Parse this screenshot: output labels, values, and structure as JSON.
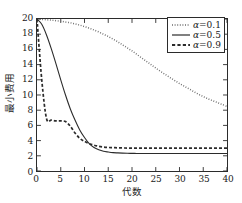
{
  "chart_data": {
    "type": "line",
    "title": "",
    "xlabel": "代数",
    "ylabel": "最小费用",
    "xlim": [
      0,
      40
    ],
    "ylim": [
      0,
      20
    ],
    "xticks": [
      0,
      5,
      10,
      15,
      20,
      25,
      30,
      35,
      40
    ],
    "yticks": [
      0,
      2,
      4,
      6,
      8,
      10,
      12,
      14,
      16,
      18,
      20
    ],
    "grid": false,
    "legend_position": "upper right",
    "series": [
      {
        "name": "α=0.1",
        "symbol": "α",
        "value": "0.1",
        "style": "dotted",
        "color": "#6b6b6b",
        "x": [
          0,
          1,
          2,
          3,
          4,
          5,
          6,
          7,
          8,
          9,
          10,
          11,
          12,
          13,
          14,
          15,
          16,
          17,
          18,
          19,
          20,
          21,
          22,
          23,
          24,
          25,
          26,
          27,
          28,
          29,
          30,
          31,
          32,
          33,
          34,
          35,
          36,
          37,
          38,
          39,
          40
        ],
        "y": [
          20.0,
          19.95,
          19.9,
          19.85,
          19.78,
          19.7,
          19.6,
          19.5,
          19.35,
          19.2,
          19.0,
          18.8,
          18.55,
          18.3,
          18.0,
          17.7,
          17.35,
          17.0,
          16.6,
          16.2,
          15.8,
          15.35,
          14.9,
          14.45,
          14.0,
          13.55,
          13.1,
          12.7,
          12.3,
          11.9,
          11.5,
          11.15,
          10.8,
          10.45,
          10.1,
          9.8,
          9.5,
          9.25,
          9.0,
          8.75,
          8.5
        ]
      },
      {
        "name": "α=0.5",
        "symbol": "α",
        "value": "0.5",
        "style": "solid",
        "color": "#2b2b2b",
        "x": [
          0,
          1,
          2,
          3,
          4,
          5,
          6,
          7,
          8,
          9,
          10,
          11,
          12,
          13,
          14,
          15,
          16,
          17,
          18,
          19,
          20,
          21,
          22,
          23,
          24,
          25,
          26,
          27,
          28,
          29,
          30,
          31,
          32,
          33,
          34,
          35,
          36,
          37,
          38,
          39,
          40
        ],
        "y": [
          20.0,
          19.3,
          17.9,
          16.1,
          14.1,
          12.0,
          10.0,
          8.2,
          6.7,
          5.4,
          4.4,
          3.6,
          3.1,
          2.8,
          2.6,
          2.5,
          2.42,
          2.38,
          2.35,
          2.33,
          2.32,
          2.31,
          2.3,
          2.3,
          2.3,
          2.3,
          2.3,
          2.3,
          2.3,
          2.3,
          2.3,
          2.3,
          2.3,
          2.3,
          2.3,
          2.3,
          2.3,
          2.3,
          2.3,
          2.3,
          2.3
        ]
      },
      {
        "name": "α=0.9",
        "symbol": "α",
        "value": "0.9",
        "style": "dashed",
        "color": "#2b2b2b",
        "x": [
          0,
          1,
          2,
          3,
          4,
          5,
          6,
          7,
          8,
          9,
          10,
          11,
          12,
          13,
          14,
          15,
          16,
          17,
          18,
          19,
          20,
          21,
          22,
          23,
          24,
          25,
          26,
          27,
          28,
          29,
          30,
          31,
          32,
          33,
          34,
          35,
          36,
          37,
          38,
          39,
          40
        ],
        "y": [
          20.0,
          12.0,
          6.9,
          6.7,
          6.6,
          6.6,
          6.5,
          5.9,
          5.0,
          4.3,
          3.9,
          3.6,
          3.4,
          3.25,
          3.15,
          3.1,
          3.08,
          3.05,
          3.03,
          3.02,
          3.0,
          3.0,
          3.0,
          3.0,
          3.0,
          3.0,
          3.0,
          3.0,
          3.0,
          3.0,
          3.0,
          3.0,
          3.0,
          3.0,
          3.0,
          3.0,
          3.0,
          3.0,
          3.0,
          3.0,
          3.0
        ]
      }
    ]
  },
  "axes": {
    "ytick_labels": [
      "0",
      "2",
      "4",
      "6",
      "8",
      "10",
      "12",
      "14",
      "16",
      "18",
      "20"
    ],
    "xtick_labels": [
      "0",
      "5",
      "10",
      "15",
      "20",
      "25",
      "30",
      "35",
      "40"
    ],
    "xlabel": "代数",
    "ylabel": "最小费用"
  },
  "legend": {
    "entries": [
      {
        "label": "α=0.1",
        "sym": "α",
        "eq": "=0.1",
        "style": "dotted"
      },
      {
        "label": "α=0.5",
        "sym": "α",
        "eq": "=0.5",
        "style": "solid"
      },
      {
        "label": "α=0.9",
        "sym": "α",
        "eq": "=0.9",
        "style": "dashed"
      }
    ]
  }
}
